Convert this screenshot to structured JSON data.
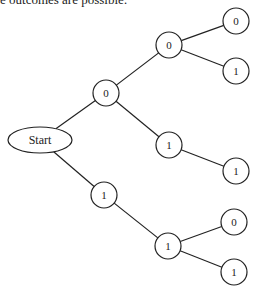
{
  "caption": "e outcomes are possible:",
  "tree": {
    "root": {
      "label": "Start",
      "cx": 40,
      "cy": 140,
      "rx": 32,
      "ry": 13
    },
    "nodes": [
      {
        "id": "n0",
        "label": "0",
        "cx": 106,
        "cy": 93
      },
      {
        "id": "n1",
        "label": "1",
        "cx": 104,
        "cy": 195
      },
      {
        "id": "n00",
        "label": "0",
        "cx": 169,
        "cy": 45
      },
      {
        "id": "n01",
        "label": "1",
        "cx": 169,
        "cy": 145
      },
      {
        "id": "n11",
        "label": "1",
        "cx": 168,
        "cy": 246
      },
      {
        "id": "n000",
        "label": "0",
        "cx": 236,
        "cy": 21
      },
      {
        "id": "n001",
        "label": "1",
        "cx": 236,
        "cy": 71
      },
      {
        "id": "n011",
        "label": "1",
        "cx": 236,
        "cy": 171
      },
      {
        "id": "n110",
        "label": "0",
        "cx": 234,
        "cy": 222
      },
      {
        "id": "n111",
        "label": "1",
        "cx": 234,
        "cy": 272
      }
    ],
    "edges": [
      [
        "root",
        "n0"
      ],
      [
        "root",
        "n1"
      ],
      [
        "n0",
        "n00"
      ],
      [
        "n0",
        "n01"
      ],
      [
        "n1",
        "n11"
      ],
      [
        "n00",
        "n000"
      ],
      [
        "n00",
        "n001"
      ],
      [
        "n01",
        "n011"
      ],
      [
        "n11",
        "n110"
      ],
      [
        "n11",
        "n111"
      ]
    ],
    "node_radius": 13,
    "stroke_color": "#222222"
  }
}
